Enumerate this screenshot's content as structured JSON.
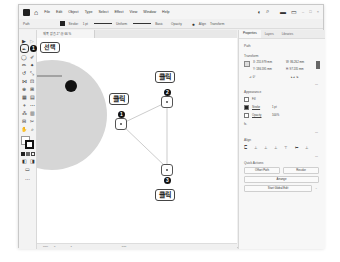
{
  "menubar": {
    "items": [
      "File",
      "Edit",
      "Object",
      "Type",
      "Select",
      "Effect",
      "View",
      "Window",
      "Help"
    ]
  },
  "control_bar": {
    "selection": "Path",
    "stroke_label": "Stroke:",
    "stroke_value": "1 pt",
    "profile": "Uniform",
    "brush": "Basic",
    "style": "Opacity"
  },
  "document_tab": {
    "title": "제목 없음-1* @ 66 % (CMYK/Preview)"
  },
  "callouts": {
    "select": {
      "number": "1",
      "label": "선택"
    },
    "click1": {
      "number": "1",
      "label": "클릭"
    },
    "click2": {
      "number": "2",
      "label": "클릭"
    },
    "click3": {
      "number": "3",
      "label": "클릭"
    }
  },
  "status_bar": {
    "zoom": "66%",
    "page": "1",
    "tool": "Pen"
  },
  "panel": {
    "tabs": [
      "Properties",
      "Layers",
      "Libraries"
    ],
    "selection_type": "Path",
    "transform": {
      "title": "Transform",
      "x": "255.979 mm",
      "y": "186.595 mm",
      "w": "86.262 mm",
      "h": "97.135 mm",
      "angle": "0°"
    },
    "appearance": {
      "title": "Appearance",
      "fill_label": "Fill",
      "stroke_label": "Stroke",
      "stroke_value": "1 pt",
      "opacity_label": "Opacity",
      "opacity_value": "100%",
      "fx_label": "fx."
    },
    "align": {
      "title": "Align"
    },
    "quick_actions": {
      "title": "Quick Actions",
      "offset_path": "Offset Path",
      "recolor": "Recolor",
      "arrange": "Arrange",
      "start_global_edit": "Start Global Edit"
    }
  }
}
